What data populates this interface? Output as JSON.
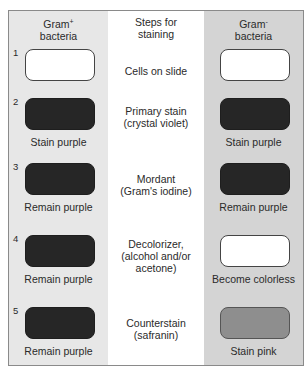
{
  "headers": {
    "left": {
      "line1": "Gram",
      "sup": "+",
      "line2": "bacteria"
    },
    "middle": {
      "line1": "Steps for",
      "line2": "staining"
    },
    "right": {
      "line1": "Gram",
      "sup": "-",
      "line2": "bacteria"
    }
  },
  "steps": [
    {
      "number": "1",
      "step_lines": [
        "Cells on slide"
      ],
      "left_color": "white",
      "left_result": "",
      "right_color": "white",
      "right_result": ""
    },
    {
      "number": "2",
      "step_lines": [
        "Primary stain",
        "(crystal violet)"
      ],
      "left_color": "purple",
      "left_result": "Stain purple",
      "right_color": "purple",
      "right_result": "Stain purple"
    },
    {
      "number": "3",
      "step_lines": [
        "Mordant",
        "(Gram's iodine)"
      ],
      "left_color": "purple",
      "left_result": "Remain purple",
      "right_color": "purple",
      "right_result": "Remain purple"
    },
    {
      "number": "4",
      "step_lines": [
        "Decolorizer,",
        "(alcohol and/or",
        "acetone)"
      ],
      "left_color": "purple",
      "left_result": "Remain purple",
      "right_color": "colorless",
      "right_result": "Become colorless"
    },
    {
      "number": "5",
      "step_lines": [
        "Counterstain",
        "(safranin)"
      ],
      "left_color": "purple",
      "left_result": "Remain purple",
      "right_color": "pink",
      "right_result": "Stain pink"
    }
  ],
  "colors": {
    "left_column_bg": "#e7e7e7",
    "right_column_bg": "#d4d4d4",
    "purple_box": "#262626",
    "pink_box": "#8e8e8e",
    "white_box": "#ffffff"
  }
}
